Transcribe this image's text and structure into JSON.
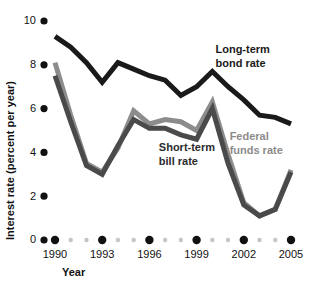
{
  "chart_data": {
    "type": "line",
    "title": "",
    "xlabel": "Year",
    "ylabel": "Interest rate (percent per year)",
    "xlim": [
      1990,
      2005
    ],
    "ylim": [
      0,
      10
    ],
    "grid": false,
    "legend_position": "inline-annotations",
    "x": [
      1990,
      1991,
      1992,
      1993,
      1994,
      1995,
      1996,
      1997,
      1998,
      1999,
      2000,
      2001,
      2002,
      2003,
      2004,
      2005
    ],
    "y_ticks": [
      0,
      2,
      4,
      6,
      8,
      10
    ],
    "y_tick_labels": [
      "0",
      "2",
      "4",
      "6",
      "8",
      "10"
    ],
    "x_major_ticks": [
      1990,
      1993,
      1996,
      1999,
      2002,
      2005
    ],
    "x_major_tick_labels": [
      "1990",
      "1993",
      "1996",
      "1999",
      "2002",
      "2005"
    ],
    "x_minor_ticks": [
      1991,
      1992,
      1994,
      1995,
      1997,
      1998,
      2000,
      2001,
      2003,
      2004
    ],
    "series": [
      {
        "name": "Long-term bond rate",
        "color": "#1a1a1a",
        "label_color": "#1a1a1a",
        "stroke_width": 5,
        "label_x": 2000.2,
        "label_y": 8.55,
        "label_lines": [
          "Long-term",
          "bond rate"
        ],
        "values": [
          9.3,
          8.8,
          8.1,
          7.2,
          8.1,
          7.8,
          7.5,
          7.3,
          6.6,
          7.0,
          7.7,
          7.0,
          6.4,
          5.7,
          5.6,
          5.3
        ]
      },
      {
        "name": "Short-term bill rate",
        "color": "#4a4a4a",
        "label_color": "#2b2b2b",
        "stroke_width": 5,
        "label_x": 1996.6,
        "label_y": 4.05,
        "label_lines": [
          "Short-term",
          "bill rate"
        ],
        "values": [
          7.5,
          5.4,
          3.4,
          3.0,
          4.3,
          5.5,
          5.1,
          5.1,
          4.8,
          4.6,
          6.0,
          3.5,
          1.6,
          1.1,
          1.4,
          3.1
        ]
      },
      {
        "name": "Federal funds rate",
        "color": "#8c8c8c",
        "label_color": "#8c8c8c",
        "stroke_width": 5,
        "label_x": 2001.1,
        "label_y": 4.55,
        "label_lines": [
          "Federal",
          "funds rate"
        ],
        "values": [
          8.1,
          5.7,
          3.5,
          3.1,
          4.2,
          5.9,
          5.3,
          5.5,
          5.4,
          5.0,
          6.3,
          3.9,
          1.7,
          1.1,
          1.4,
          3.2
        ]
      }
    ]
  },
  "axes": {
    "y_title": "Interest rate (percent per year)",
    "x_title": "Year",
    "tick_dot_color_major": "#111111",
    "tick_dot_color_minor": "#c4c4c4"
  }
}
